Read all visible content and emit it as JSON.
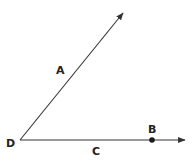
{
  "diagram": {
    "type": "angle",
    "colors": {
      "line": "#333333",
      "point": "#1a1a1a",
      "background": "#ffffff"
    },
    "vertex": {
      "label": "D",
      "x": 20,
      "y": 140
    },
    "rays": [
      {
        "id": "ray-upper",
        "label": "A",
        "from": [
          20,
          140
        ],
        "to": [
          124,
          12
        ]
      },
      {
        "id": "ray-horizontal",
        "label": "C",
        "from": [
          20,
          140
        ],
        "to": [
          186,
          140
        ]
      }
    ],
    "points": [
      {
        "label": "B",
        "x": 152,
        "y": 140
      }
    ],
    "labels": {
      "A": "A",
      "B": "B",
      "C": "C",
      "D": "D"
    }
  }
}
